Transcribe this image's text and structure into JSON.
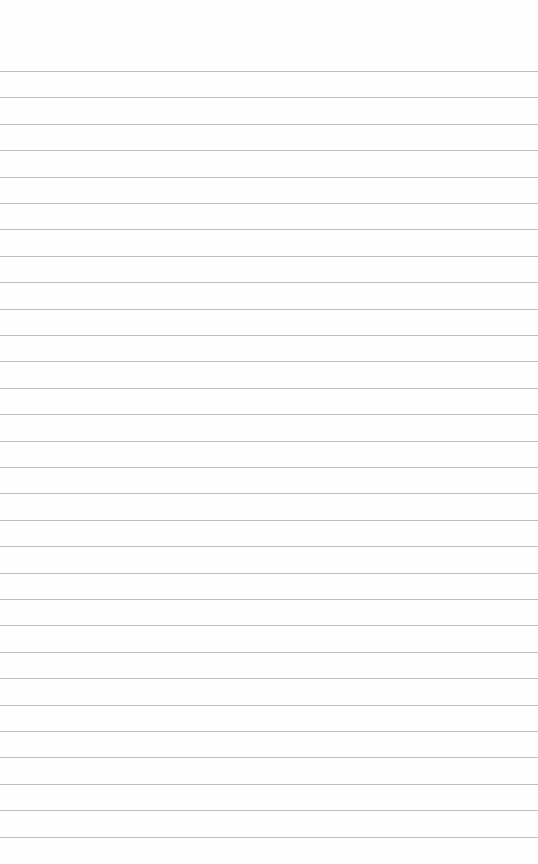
{
  "paper": {
    "background": "#fefefe",
    "line_color": "#bdbdbd",
    "first_line_y": 71,
    "line_spacing": 26.4,
    "line_count": 31
  }
}
